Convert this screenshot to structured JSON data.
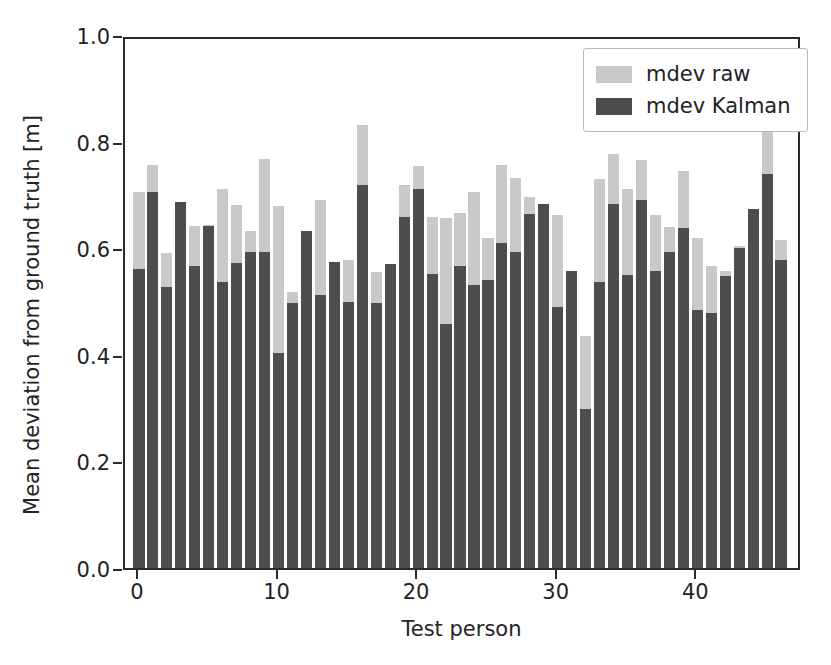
{
  "chart_data": {
    "type": "bar",
    "subtype": "overlaid-bar",
    "title": "",
    "xlabel": "Test person",
    "ylabel": "Mean deviation from ground truth [m]",
    "xlim": [
      -1,
      47.5
    ],
    "ylim": [
      0.0,
      1.0
    ],
    "grid": false,
    "legend_position": "upper right",
    "xticks": [
      0,
      10,
      20,
      30,
      40
    ],
    "xtick_labels": [
      "0",
      "10",
      "20",
      "30",
      "40"
    ],
    "yticks": [
      0.0,
      0.2,
      0.4,
      0.6,
      0.8,
      1.0
    ],
    "ytick_labels": [
      "0.0",
      "0.2",
      "0.4",
      "0.6",
      "0.8",
      "1.0"
    ],
    "categories": [
      0,
      1,
      2,
      3,
      4,
      5,
      6,
      7,
      8,
      9,
      10,
      11,
      12,
      13,
      14,
      15,
      16,
      17,
      18,
      19,
      20,
      21,
      22,
      23,
      24,
      25,
      26,
      27,
      28,
      29,
      30,
      31,
      32,
      33,
      34,
      35,
      36,
      37,
      38,
      39,
      40,
      41,
      42,
      43,
      44,
      45,
      46
    ],
    "series": [
      {
        "name": "mdev raw",
        "color": "#c9c9c9",
        "values": [
          0.705,
          0.757,
          0.591,
          0.686,
          0.641,
          0.644,
          0.712,
          0.682,
          0.632,
          0.768,
          0.68,
          0.517,
          0.632,
          0.691,
          0.575,
          0.578,
          0.832,
          0.556,
          0.571,
          0.718,
          0.755,
          0.658,
          0.657,
          0.666,
          0.706,
          0.62,
          0.756,
          0.732,
          0.697,
          0.683,
          0.662,
          0.558,
          0.435,
          0.73,
          0.777,
          0.711,
          0.766,
          0.662,
          0.639,
          0.745,
          0.62,
          0.566,
          0.557,
          0.605,
          0.674,
          0.839,
          0.616
        ]
      },
      {
        "name": "mdev Kalman",
        "color": "#4d4d4d",
        "values": [
          0.561,
          0.705,
          0.527,
          0.686,
          0.566,
          0.641,
          0.537,
          0.573,
          0.593,
          0.592,
          0.404,
          0.498,
          0.632,
          0.513,
          0.575,
          0.5,
          0.718,
          0.497,
          0.571,
          0.659,
          0.712,
          0.551,
          0.458,
          0.566,
          0.531,
          0.54,
          0.61,
          0.592,
          0.665,
          0.683,
          0.489,
          0.558,
          0.298,
          0.536,
          0.683,
          0.549,
          0.69,
          0.557,
          0.593,
          0.638,
          0.484,
          0.479,
          0.548,
          0.601,
          0.674,
          0.739,
          0.578
        ]
      }
    ]
  },
  "legend": {
    "items": [
      {
        "label": "mdev raw",
        "color": "#c9c9c9"
      },
      {
        "label": "mdev Kalman",
        "color": "#4d4d4d"
      }
    ]
  },
  "colors": {
    "raw": "#c9c9c9",
    "kalman": "#4d4d4d",
    "axis": "#2b2b2b",
    "text": "#232323",
    "background": "#ffffff"
  }
}
